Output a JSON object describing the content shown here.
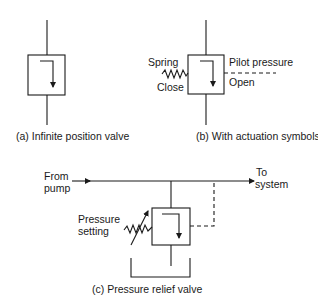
{
  "figures": {
    "a": {
      "caption": "(a)  Infinite position valve"
    },
    "b": {
      "caption": "(b)  With actuation symbols",
      "labels": {
        "spring": "Spring",
        "close": "Close",
        "pilot_pressure": "Pilot pressure",
        "open": "Open"
      }
    },
    "c": {
      "caption": "(c)  Pressure relief valve",
      "labels": {
        "from_line1": "From",
        "from_line2": "pump",
        "to_line1": "To",
        "to_line2": "system",
        "setting_line1": "Pressure",
        "setting_line2": "setting"
      }
    }
  },
  "colors": {
    "ink": "#1a1a1a",
    "background": "#ffffff"
  }
}
